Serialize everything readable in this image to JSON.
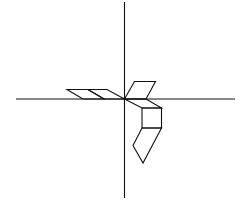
{
  "diagram": {
    "stroke_color": "#111111",
    "background": "#ffffff",
    "axes": {
      "vertical": {
        "x1": 124.5,
        "y1": 2,
        "x2": 124.5,
        "y2": 198
      },
      "horizontal": {
        "x1": 16,
        "y1": 99,
        "x2": 235,
        "y2": 99
      }
    },
    "shapes": [
      {
        "name": "left-parallelogram-outer",
        "points": "67,89.5 88,89.5 104,99 83,99"
      },
      {
        "name": "left-parallelogram-inner",
        "points": "88,89.5 107,89.5 124.5,99 104,99"
      },
      {
        "name": "upper-right-parallelogram",
        "points": "124.5,99 134.5,81.5 155.5,81.5 146,99"
      },
      {
        "name": "square-top-parallelogram",
        "points": "124.5,99 146,99 161.5,108 142,108"
      },
      {
        "name": "square",
        "points": "142,108 161.5,108 161.5,128 142,128"
      },
      {
        "name": "lower-pentagon",
        "points": "142,128 161.5,128 143,163 133,145.5"
      }
    ]
  }
}
